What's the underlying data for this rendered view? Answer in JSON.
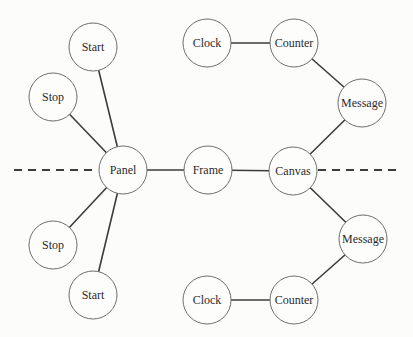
{
  "diagram": {
    "background": "#fcfcfb",
    "node_fill": "#fdfdfc",
    "node_stroke": "#6e6e6e",
    "edge_color": "#3c3c3c",
    "text_color": "#2b2b2b",
    "node_radius": 24,
    "font_size": 12,
    "nodes": [
      {
        "id": "start-top",
        "label": "Start",
        "x": 93,
        "y": 47
      },
      {
        "id": "stop-top",
        "label": "Stop",
        "x": 53,
        "y": 97
      },
      {
        "id": "clock-top",
        "label": "Clock",
        "x": 207,
        "y": 43
      },
      {
        "id": "counter-top",
        "label": "Counter",
        "x": 294,
        "y": 43
      },
      {
        "id": "message-top",
        "label": "Message",
        "x": 362,
        "y": 103
      },
      {
        "id": "panel",
        "label": "Panel",
        "x": 123,
        "y": 170
      },
      {
        "id": "frame",
        "label": "Frame",
        "x": 208,
        "y": 170
      },
      {
        "id": "canvas",
        "label": "Canvas",
        "x": 293,
        "y": 171
      },
      {
        "id": "stop-bottom",
        "label": "Stop",
        "x": 53,
        "y": 245
      },
      {
        "id": "start-bottom",
        "label": "Start",
        "x": 93,
        "y": 295
      },
      {
        "id": "message-bottom",
        "label": "Message",
        "x": 363,
        "y": 239
      },
      {
        "id": "counter-bottom",
        "label": "Counter",
        "x": 294,
        "y": 300
      },
      {
        "id": "clock-bottom",
        "label": "Clock",
        "x": 207,
        "y": 300
      }
    ],
    "edges": [
      {
        "from": "start-top",
        "to": "panel"
      },
      {
        "from": "stop-top",
        "to": "panel"
      },
      {
        "from": "clock-top",
        "to": "counter-top"
      },
      {
        "from": "counter-top",
        "to": "message-top"
      },
      {
        "from": "message-top",
        "to": "canvas"
      },
      {
        "from": "panel",
        "to": "frame"
      },
      {
        "from": "frame",
        "to": "canvas"
      },
      {
        "from": "panel",
        "to": "stop-bottom"
      },
      {
        "from": "panel",
        "to": "start-bottom"
      },
      {
        "from": "canvas",
        "to": "message-bottom"
      },
      {
        "from": "message-bottom",
        "to": "counter-bottom"
      },
      {
        "from": "counter-bottom",
        "to": "clock-bottom"
      }
    ],
    "dashed_segments": [
      {
        "id": "left",
        "x1": 14,
        "y1": 170,
        "x2": 98,
        "y2": 170
      },
      {
        "id": "right",
        "x1": 318,
        "y1": 170,
        "x2": 401,
        "y2": 170
      }
    ]
  }
}
